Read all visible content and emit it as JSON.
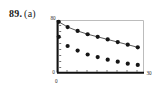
{
  "figure": {
    "problem_number": "89.",
    "part_letter": "(a)"
  },
  "chart_data": {
    "type": "scatter",
    "title": "",
    "xlabel": "",
    "ylabel": "",
    "xlim": [
      0,
      30
    ],
    "ylim": [
      0,
      80
    ],
    "grid": false,
    "legend": "none",
    "axis_tick_labels": {
      "y_top": "80",
      "y_bottom": "0",
      "x_left": "0",
      "x_right": "30"
    },
    "series": [
      {
        "name": "upper-series",
        "marker": "filled-circle",
        "line": true,
        "x": [
          0.4,
          3.5,
          7.0,
          10.5,
          14.0,
          17.5,
          21.0,
          24.5,
          28.0
        ],
        "y": [
          78,
          70,
          64,
          59,
          55,
          51,
          47,
          43,
          39
        ]
      },
      {
        "name": "lower-series",
        "marker": "filled-circle",
        "line": false,
        "x": [
          0.4,
          3.5,
          7.0,
          10.5,
          14.0,
          17.5,
          21.0,
          24.5,
          28.0
        ],
        "y": [
          55,
          41,
          34,
          28,
          24,
          20,
          17,
          14,
          12
        ]
      }
    ]
  }
}
